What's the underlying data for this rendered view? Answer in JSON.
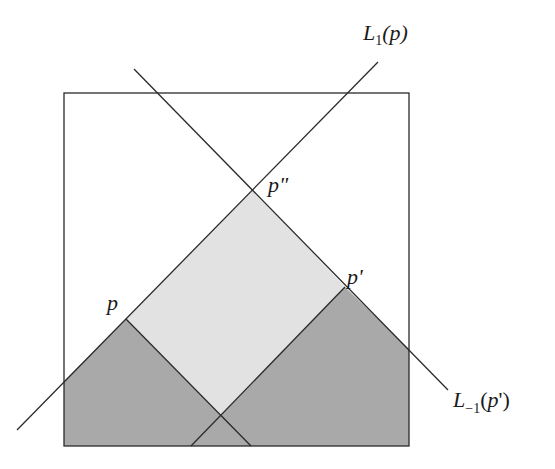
{
  "diagram": {
    "colors": {
      "background": "#ffffff",
      "stroke": "#2a2a2a",
      "light_region": "#e2e2e2",
      "dark_region": "#a9a9a9"
    },
    "box": {
      "x1": 64,
      "y1": 93,
      "x2": 409,
      "y2": 446
    },
    "points": {
      "p": {
        "label": "p",
        "x": 126,
        "y": 319
      },
      "p_double_prime": {
        "label": "p\"",
        "x": 253,
        "y": 190
      },
      "p_prime": {
        "label": "p'",
        "x": 345,
        "y": 287
      },
      "cross": {
        "x": 221,
        "y": 414
      }
    },
    "lines": [
      {
        "name": "L_1(p)",
        "from": [
          17,
          430
        ],
        "to": [
          378,
          62
        ]
      },
      {
        "name": "L_-1(p')",
        "from": [
          134,
          69
        ],
        "to": [
          448,
          390
        ]
      },
      {
        "name": "p-descending",
        "from": [
          126,
          319
        ],
        "to": [
          251,
          446
        ]
      },
      {
        "name": "p-prime-descending",
        "from": [
          345,
          287
        ],
        "to": [
          191,
          446
        ]
      }
    ],
    "labels": {
      "L1p": {
        "main": "L",
        "sub": "1",
        "arg": "(p)"
      },
      "Lm1p": {
        "main": "L",
        "sub": "−1",
        "arg_open": "(",
        "arg_p": "p",
        "arg_close": "')"
      },
      "p": "p",
      "p_prime": "p'",
      "p_double_prime": "p\""
    }
  }
}
